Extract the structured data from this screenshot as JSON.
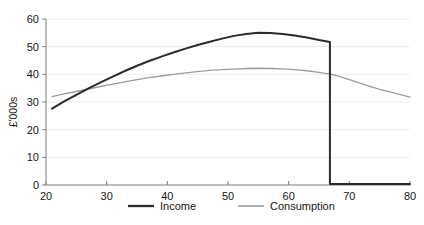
{
  "chart_data": {
    "type": "line",
    "title": "",
    "subtitle": "",
    "xlabel": "",
    "ylabel": "£'000s",
    "xlim": [
      20,
      80
    ],
    "ylim": [
      0,
      60
    ],
    "xticks": [
      20,
      30,
      40,
      50,
      60,
      70,
      80
    ],
    "yticks": [
      0,
      10,
      20,
      30,
      40,
      50,
      60
    ],
    "xtick_labels": [
      "20",
      "30",
      "40",
      "50",
      "60",
      "70",
      "80"
    ],
    "ytick_labels": [
      "0",
      "10",
      "20",
      "30",
      "40",
      "50",
      "60"
    ],
    "grid": "horizontal",
    "grid_color": "#ededed",
    "axis_color": "#8a8a8a",
    "legend_position": "bottom-center",
    "x": [
      21,
      23,
      25,
      27,
      29,
      31,
      33,
      35,
      37,
      39,
      41,
      43,
      45,
      47,
      49,
      51,
      53,
      55,
      57,
      59,
      61,
      63,
      65,
      66.8,
      67.6,
      69,
      71,
      73,
      75,
      77,
      80
    ],
    "series": [
      {
        "name": "Income",
        "color": "#2b2b2b",
        "width": 2.0,
        "values": [
          27.6,
          30.2,
          32.6,
          34.9,
          37.1,
          39.2,
          41.2,
          43.1,
          44.8,
          46.4,
          47.9,
          49.3,
          50.6,
          51.8,
          52.9,
          53.9,
          54.6,
          55.0,
          54.9,
          54.6,
          54.0,
          53.3,
          52.4,
          51.7,
          0.4,
          0.4,
          0.4,
          0.4,
          0.4,
          0.4,
          0.4
        ]
      },
      {
        "name": "Consumption",
        "color": "#9c9c9c",
        "width": 1.3,
        "values": [
          31.9,
          32.9,
          33.8,
          34.7,
          35.6,
          36.5,
          37.3,
          38.1,
          38.8,
          39.4,
          40.0,
          40.5,
          41.0,
          41.4,
          41.7,
          41.9,
          42.1,
          42.2,
          42.1,
          42.0,
          41.7,
          41.3,
          40.7,
          40.1,
          39.7,
          38.8,
          37.4,
          35.9,
          34.6,
          33.5,
          31.8
        ]
      }
    ],
    "annotations": [
      {
        "label": "income-drop-at-retirement",
        "x": 67.2,
        "from_y": 51.7,
        "to_y": 0.4
      }
    ]
  },
  "legend": {
    "items": [
      {
        "label": "Income",
        "swatch": "dark-solid-line"
      },
      {
        "label": "Consumption",
        "swatch": "light-solid-line"
      }
    ]
  }
}
